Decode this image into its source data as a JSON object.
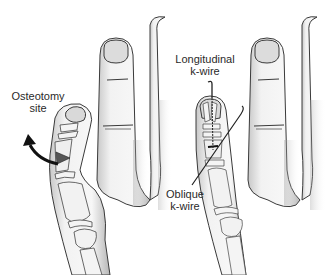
{
  "figure": {
    "panels": [
      {
        "id": "before",
        "labels": [
          {
            "name": "osteotomy-site",
            "line1": "Osteotomy",
            "line2": "site"
          }
        ],
        "annotations": [
          "curved-arrow-rotation",
          "wedge-osteotomy"
        ]
      },
      {
        "id": "after",
        "labels": [
          {
            "name": "longitudinal-k-wire",
            "line1": "Longitudinal",
            "line2": "k-wire"
          },
          {
            "name": "oblique-k-wire",
            "line1": "Oblique",
            "line2": "k-wire"
          }
        ]
      }
    ],
    "colors": {
      "background": "#ffffff",
      "outline": "#3a3a3a",
      "skin_shade": "#d9d9d9",
      "bone": "#f4f4f4",
      "text": "#2a2a2a",
      "arrow": "#111111"
    }
  }
}
